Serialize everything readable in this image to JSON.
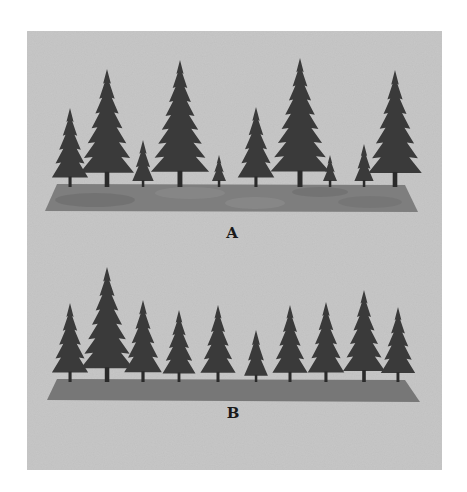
{
  "figure": {
    "background_color": "#c8c8c8",
    "tree_color": "#3a3a3a",
    "ground_a_color": "#7c7c7c",
    "ground_b_color": "#767676"
  },
  "panels": [
    {
      "label": "A",
      "description": "uneven-aged stand: trees of widely varying heights on patchy ground",
      "trees": [
        {
          "x": 70,
          "top": 108
        },
        {
          "x": 107,
          "top": 69
        },
        {
          "x": 143,
          "top": 140
        },
        {
          "x": 180,
          "top": 60
        },
        {
          "x": 219,
          "top": 155
        },
        {
          "x": 256,
          "top": 107
        },
        {
          "x": 300,
          "top": 58
        },
        {
          "x": 330,
          "top": 155
        },
        {
          "x": 364,
          "top": 144
        },
        {
          "x": 395,
          "top": 70
        }
      ],
      "base": 187
    },
    {
      "label": "B",
      "description": "even-aged stand: trees of similar heights on uniform ground",
      "trees": [
        {
          "x": 70,
          "top": 303
        },
        {
          "x": 107,
          "top": 267
        },
        {
          "x": 143,
          "top": 300
        },
        {
          "x": 179,
          "top": 310
        },
        {
          "x": 218,
          "top": 305
        },
        {
          "x": 256,
          "top": 330
        },
        {
          "x": 290,
          "top": 305
        },
        {
          "x": 326,
          "top": 302
        },
        {
          "x": 364,
          "top": 290
        },
        {
          "x": 398,
          "top": 307
        }
      ],
      "base": 382
    }
  ]
}
